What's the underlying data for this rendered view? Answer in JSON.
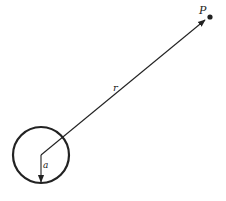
{
  "diagram": {
    "labels": {
      "point": "P",
      "distance": "r",
      "radius": "a"
    },
    "colors": {
      "stroke": "#222222",
      "background": "#ffffff"
    }
  }
}
